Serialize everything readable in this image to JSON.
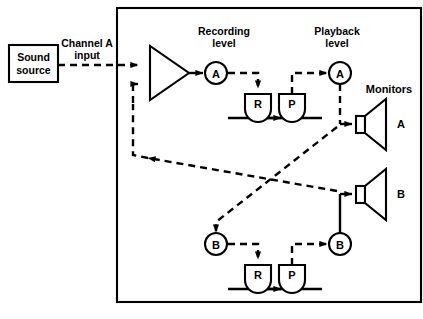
{
  "diagram": {
    "title_visible": false,
    "type": "tape-recorder-signal-flow-block-diagram",
    "colors": {
      "line": "#000000",
      "background": "#ffffff",
      "fill": "#ffffff"
    },
    "external": {
      "sound_source": {
        "line1": "Sound",
        "line2": "source"
      },
      "input_label": {
        "line1": "Channel A",
        "line2": "input"
      }
    },
    "labels": {
      "recording_level": {
        "line1": "Recording",
        "line2": "level"
      },
      "playback_level": {
        "line1": "Playback",
        "line2": "level"
      },
      "monitors": "Monitors"
    },
    "channels": {
      "a": {
        "record_level_node": "A",
        "playback_level_node": "A",
        "record_head": "R",
        "playback_head": "P",
        "monitor_label": "A"
      },
      "b": {
        "record_level_node": "B",
        "playback_level_node": "B",
        "record_head": "R",
        "playback_head": "P",
        "monitor_label": "B"
      }
    },
    "components": {
      "amplifier": "amplifier-triangle",
      "record_head_icon": "record-head",
      "playback_head_icon": "playback-head",
      "speaker_icon": "monitor-speaker",
      "tape_path_icon": "tape-transport-line"
    }
  }
}
